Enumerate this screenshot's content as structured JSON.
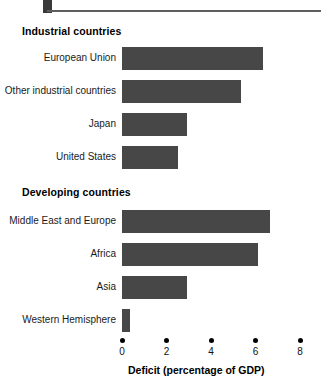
{
  "decoration": {
    "square": "square-mark",
    "rule": "horizontal-rule"
  },
  "chart_data": {
    "type": "bar",
    "orientation": "horizontal",
    "title": "",
    "xlabel": "Deficit (percentage of GDP)",
    "ylabel": "",
    "xlim": [
      0,
      8
    ],
    "xticks": [
      0,
      2,
      4,
      6,
      8
    ],
    "xticklabels": [
      "0",
      "2",
      "4",
      "6",
      "8"
    ],
    "grid": false,
    "legend": false,
    "bar_color": "#474747",
    "groups": [
      {
        "name": "Industrial countries",
        "categories": [
          "European Union",
          "Other industrial countries",
          "Japan",
          "United States"
        ],
        "values": [
          6.35,
          5.35,
          2.9,
          2.5
        ]
      },
      {
        "name": "Developing countries",
        "categories": [
          "Middle East and Europe",
          "Africa",
          "Asia",
          "Western Hemisphere"
        ],
        "values": [
          6.65,
          6.1,
          2.9,
          0.35
        ]
      }
    ],
    "categories": [
      "European Union",
      "Other industrial countries",
      "Japan",
      "United States",
      "Middle East and Europe",
      "Africa",
      "Asia",
      "Western Hemisphere"
    ],
    "values": [
      6.35,
      5.35,
      2.9,
      2.5,
      6.65,
      6.1,
      2.9,
      0.35
    ]
  }
}
